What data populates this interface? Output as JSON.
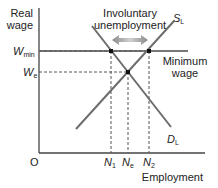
{
  "diagram": {
    "y_axis_label_line1": "Real",
    "y_axis_label_line2": "wage",
    "x_axis_label": "Employment",
    "origin_label": "O",
    "w_min_main": "W",
    "w_min_sub": "min",
    "w_e_main": "W",
    "w_e_sub": "e",
    "n1_main": "N",
    "n1_sub": "1",
    "ne_main": "N",
    "ne_sub": "e",
    "n2_main": "N",
    "n2_sub": "2",
    "supply_main": "S",
    "supply_sub": "L",
    "demand_main": "D",
    "demand_sub": "L",
    "annotation_line1": "Involuntary",
    "annotation_line2": "unemployment",
    "min_wage_line1": "Minimum",
    "min_wage_line2": "wage",
    "colors": {
      "curve": "#6d6d6d",
      "axis": "#444444",
      "min_wage_line": "#777777",
      "dashed": "#555555",
      "point": "#111111",
      "arrow": "#999999",
      "text": "#222222"
    }
  }
}
